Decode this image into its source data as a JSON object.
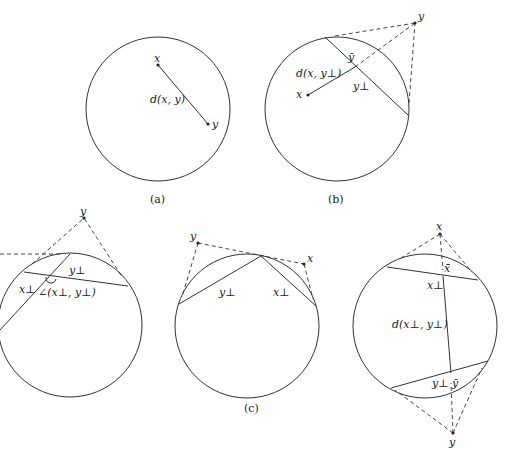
{
  "panels": {
    "a": {
      "caption": "(a)",
      "label_x": "x",
      "label_y": "y",
      "label_d": "d(x, y)"
    },
    "b": {
      "caption": "(b)",
      "label_x": "x",
      "label_y": "y",
      "label_ybar": "ȳ",
      "label_yperp": "y⊥",
      "label_d": "d(x, y⊥)"
    },
    "c": {
      "caption": "(c)",
      "left": {
        "label_y": "y",
        "label_xperp": "x⊥",
        "label_yperp": "y⊥",
        "label_angle": "∠(x⊥, y⊥)"
      },
      "middle": {
        "label_y": "y",
        "label_x": "x",
        "label_yperp": "y⊥",
        "label_xperp": "x⊥"
      },
      "right": {
        "label_x": "x",
        "label_xbar": "x̄",
        "label_xperp": "x⊥",
        "label_d": "d(x⊥, y⊥)",
        "label_yperp": "y⊥",
        "label_ybar": "ȳ",
        "label_y": "y"
      }
    }
  }
}
